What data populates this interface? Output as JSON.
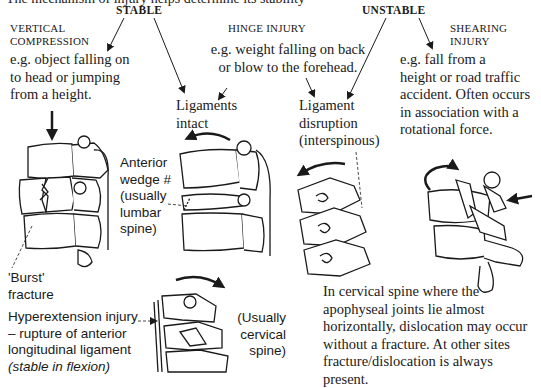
{
  "cropped_top_line": "The mechanism of injury helps determine its stability",
  "headings": {
    "stable": "STABLE",
    "unstable": "UNSTABLE"
  },
  "categories": [
    {
      "id": "vertical-compression",
      "title_lines": [
        "VERTICAL",
        "COMPRESSION"
      ],
      "stability": "stable",
      "example_lines": [
        "e.g. object falling on",
        "to head or jumping",
        "from a height."
      ],
      "illustration_label_lines": [
        "'Burst'",
        "fracture"
      ]
    },
    {
      "id": "hinge-injury",
      "title_lines": [
        "HINGE INJURY"
      ],
      "example_lines": [
        "e.g. weight falling on back",
        "or blow to the forehead."
      ],
      "outcomes": [
        {
          "stability": "stable",
          "label_lines": [
            "Ligaments",
            "intact"
          ],
          "illustration_label_lines": [
            "Anterior",
            "wedge #",
            "(usually",
            "lumbar",
            "spine)"
          ]
        },
        {
          "stability": "unstable",
          "label_lines": [
            "Ligament",
            "disruption",
            "(interspinous)"
          ]
        }
      ]
    },
    {
      "id": "shearing-injury",
      "title_lines": [
        "SHEARING",
        "INJURY"
      ],
      "stability": "unstable",
      "example_lines": [
        "e.g. fall from a",
        "height or road traffic",
        "accident. Often occurs",
        "in association with a",
        "rotational force."
      ]
    }
  ],
  "hyperextension": {
    "label_lines": [
      "Hyperextension injury",
      "– rupture of anterior",
      "longitudinal ligament"
    ],
    "italic_note": "(stable in flexion)",
    "side_label_lines": [
      "(Usually",
      "cervical",
      "spine)"
    ]
  },
  "cervical_note_lines": [
    "In cervical spine where the",
    "apophyseal joints lie almost",
    "horizontally, dislocation may occur",
    "without a fracture. At other sites",
    "fracture/dislocation is always present."
  ],
  "colors": {
    "background": "#ffffff",
    "ink": "#1a1a1a"
  }
}
